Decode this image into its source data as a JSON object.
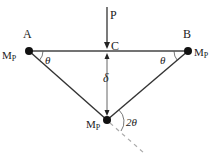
{
  "diagram": {
    "title": "",
    "type": "structural-mechanics",
    "labels": {
      "A": "A",
      "B": "B",
      "C": "C",
      "P": "P",
      "delta": "δ",
      "theta_left": "θ",
      "theta_right": "θ",
      "two_theta": "2θ",
      "mp_base": "M",
      "mp_sub": "P"
    },
    "nodes": [
      {
        "id": "A",
        "x": 29,
        "y": 51,
        "moment": "Mp"
      },
      {
        "id": "B",
        "x": 188,
        "y": 51,
        "moment": "Mp"
      },
      {
        "id": "D",
        "x": 107,
        "y": 120,
        "moment": "Mp"
      }
    ],
    "members": [
      {
        "from": "A",
        "to": "B",
        "kind": "beam"
      },
      {
        "from": "A",
        "to": "D",
        "kind": "bar"
      },
      {
        "from": "B",
        "to": "D",
        "kind": "bar"
      }
    ],
    "load": {
      "label": "P",
      "at": "C",
      "direction": "down"
    },
    "colors": {
      "line": "#333333",
      "node": "#111111",
      "dashed": "#aaaaaa"
    }
  }
}
